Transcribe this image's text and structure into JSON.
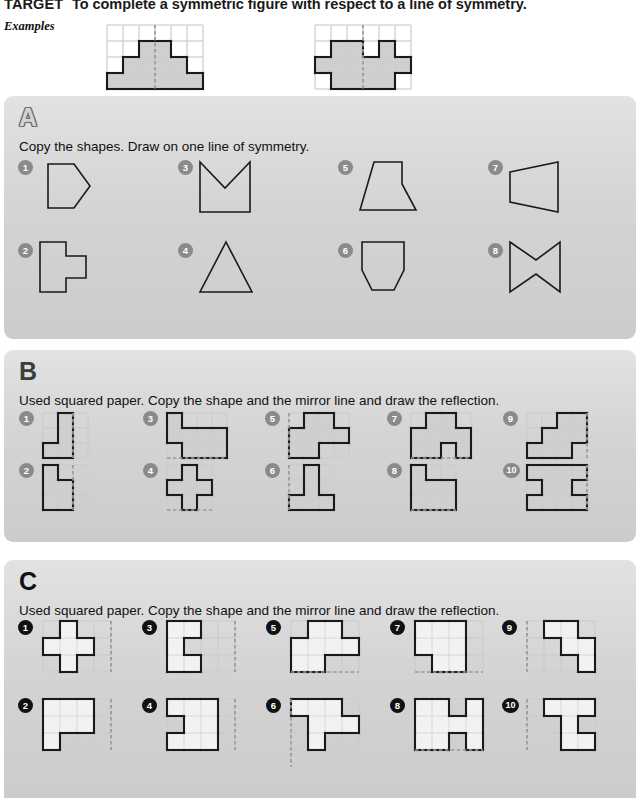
{
  "header": {
    "target_label": "TARGET",
    "target_text": "To complete a symmetric figure with respect to a line of symmetry.",
    "examples_label": "Examples"
  },
  "colors": {
    "panel_bg": "#d4d4d4",
    "shape_fill_dark": "#cfcfcf",
    "shape_fill_light": "#f2f2f2",
    "outline": "#1a1a1a",
    "grid_line": "#cdcdcd",
    "mirror_line": "#9a9a9a",
    "bullet_grey": "#8a8a8a",
    "bullet_black": "#111111"
  },
  "examples": [
    {
      "name": "example-staircase-pyramid",
      "grid": {
        "cols": 6,
        "rows": 4,
        "cell": 16
      },
      "filled_cells": [
        [
          0,
          3
        ],
        [
          1,
          3
        ],
        [
          2,
          3
        ],
        [
          3,
          3
        ],
        [
          4,
          3
        ],
        [
          5,
          3
        ],
        [
          1,
          2
        ],
        [
          2,
          2
        ],
        [
          3,
          2
        ],
        [
          4,
          2
        ],
        [
          2,
          1
        ],
        [
          3,
          1
        ]
      ],
      "mirror": {
        "orientation": "vertical",
        "at": 3
      }
    },
    {
      "name": "example-double-tower",
      "grid": {
        "cols": 6,
        "rows": 4,
        "cell": 16
      },
      "filled_cells": [
        [
          1,
          1
        ],
        [
          1,
          2
        ],
        [
          2,
          1
        ],
        [
          2,
          2
        ],
        [
          0,
          2
        ],
        [
          4,
          1
        ],
        [
          4,
          2
        ],
        [
          3,
          2
        ],
        [
          5,
          2
        ],
        [
          1,
          3
        ],
        [
          2,
          3
        ],
        [
          3,
          3
        ],
        [
          4,
          3
        ]
      ],
      "mirror": {
        "orientation": "vertical",
        "at": 3
      }
    }
  ],
  "sections": [
    {
      "id": "A",
      "letter": "A",
      "letter_style": "outline",
      "instruction": "Copy the shapes. Draw on one line of symmetry.",
      "items": [
        {
          "n": "1",
          "name": "shape-pentagon-arrow"
        },
        {
          "n": "2",
          "name": "shape-cross-tab"
        },
        {
          "n": "3",
          "name": "shape-chevron-notch"
        },
        {
          "n": "4",
          "name": "shape-triangle"
        },
        {
          "n": "5",
          "name": "shape-flask"
        },
        {
          "n": "6",
          "name": "shape-tub"
        },
        {
          "n": "7",
          "name": "shape-trapezium"
        },
        {
          "n": "8",
          "name": "shape-bowtie"
        }
      ]
    },
    {
      "id": "B",
      "letter": "B",
      "letter_style": "solid-dark",
      "instruction": "Used squared paper. Copy the shape and the mirror line and draw the reflection.",
      "items": [
        {
          "n": "1",
          "name": "grid-item-b1"
        },
        {
          "n": "2",
          "name": "grid-item-b2"
        },
        {
          "n": "3",
          "name": "grid-item-b3"
        },
        {
          "n": "4",
          "name": "grid-item-b4"
        },
        {
          "n": "5",
          "name": "grid-item-b5"
        },
        {
          "n": "6",
          "name": "grid-item-b6"
        },
        {
          "n": "7",
          "name": "grid-item-b7"
        },
        {
          "n": "8",
          "name": "grid-item-b8"
        },
        {
          "n": "9",
          "name": "grid-item-b9"
        },
        {
          "n": "10",
          "name": "grid-item-b10"
        }
      ]
    },
    {
      "id": "C",
      "letter": "C",
      "letter_style": "solid-black",
      "instruction": "Used squared paper. Copy the shape and the mirror line and draw the reflection.",
      "items": [
        {
          "n": "1",
          "name": "grid-item-c1"
        },
        {
          "n": "2",
          "name": "grid-item-c2"
        },
        {
          "n": "3",
          "name": "grid-item-c3"
        },
        {
          "n": "4",
          "name": "grid-item-c4"
        },
        {
          "n": "5",
          "name": "grid-item-c5"
        },
        {
          "n": "6",
          "name": "grid-item-c6"
        },
        {
          "n": "7",
          "name": "grid-item-c7"
        },
        {
          "n": "8",
          "name": "grid-item-c8"
        },
        {
          "n": "9",
          "name": "grid-item-c9"
        },
        {
          "n": "10",
          "name": "grid-item-c10"
        }
      ]
    }
  ],
  "section_a_shapes": {
    "1": {
      "points": "10,4 36,4 52,26 36,48 10,48",
      "w": 62,
      "h": 54
    },
    "2": {
      "points": "2,2 28,2 28,16 48,16 48,38 28,38 28,52 2,52",
      "w": 56,
      "h": 56
    },
    "3": {
      "points": "2,2 2,52 52,52 52,2 27,28",
      "w": 58,
      "h": 56
    },
    "4": {
      "points": "28,2 54,52 2,52",
      "w": 58,
      "h": 56
    },
    "5": {
      "points": "16,2 44,2 44,24 58,50 2,50",
      "w": 62,
      "h": 54
    },
    "6": {
      "points": "4,2 46,2 46,30 36,50 14,50 4,30",
      "w": 52,
      "h": 54
    },
    "7": {
      "points": "2,12 50,2 50,52 2,42",
      "w": 56,
      "h": 56
    },
    "8": {
      "points": "2,2 28,20 52,2 52,52 28,34 2,52",
      "w": 58,
      "h": 56
    }
  },
  "section_b_grids": [
    {
      "id": "b1",
      "cols": 3,
      "rows": 3,
      "cell": 15,
      "filled": [
        [
          1,
          0
        ],
        [
          1,
          1
        ],
        [
          0,
          2
        ],
        [
          1,
          2
        ]
      ],
      "mirror": {
        "orientation": "vertical",
        "at": 2
      }
    },
    {
      "id": "b2",
      "cols": 3,
      "rows": 3,
      "cell": 15,
      "filled": [
        [
          0,
          0
        ],
        [
          0,
          1
        ],
        [
          1,
          1
        ],
        [
          0,
          2
        ],
        [
          1,
          2
        ]
      ],
      "mirror": {
        "orientation": "vertical",
        "at": 2
      }
    },
    {
      "id": "b3",
      "cols": 4,
      "rows": 3,
      "cell": 15,
      "filled": [
        [
          0,
          0
        ],
        [
          0,
          1
        ],
        [
          1,
          1
        ],
        [
          2,
          1
        ],
        [
          3,
          1
        ],
        [
          1,
          2
        ],
        [
          2,
          2
        ],
        [
          3,
          2
        ]
      ],
      "mirror": {
        "orientation": "horizontal",
        "at": 3
      }
    },
    {
      "id": "b4",
      "cols": 3,
      "rows": 3,
      "cell": 15,
      "filled": [
        [
          1,
          0
        ],
        [
          0,
          1
        ],
        [
          1,
          1
        ],
        [
          2,
          1
        ],
        [
          1,
          2
        ]
      ],
      "mirror": {
        "orientation": "horizontal",
        "at": 3
      }
    },
    {
      "id": "b5",
      "cols": 4,
      "rows": 3,
      "cell": 15,
      "filled": [
        [
          1,
          0
        ],
        [
          2,
          0
        ],
        [
          0,
          1
        ],
        [
          1,
          1
        ],
        [
          2,
          1
        ],
        [
          3,
          1
        ],
        [
          0,
          2
        ],
        [
          1,
          2
        ]
      ],
      "mirror": {
        "orientation": "vertical",
        "at": 0
      }
    },
    {
      "id": "b6",
      "cols": 3,
      "rows": 3,
      "cell": 15,
      "filled": [
        [
          1,
          0
        ],
        [
          1,
          1
        ],
        [
          0,
          2
        ],
        [
          1,
          2
        ],
        [
          2,
          2
        ]
      ],
      "mirror": {
        "orientation": "vertical",
        "at": 0
      }
    },
    {
      "id": "b7",
      "cols": 4,
      "rows": 3,
      "cell": 15,
      "filled": [
        [
          1,
          0
        ],
        [
          2,
          0
        ],
        [
          0,
          1
        ],
        [
          1,
          1
        ],
        [
          2,
          1
        ],
        [
          3,
          1
        ],
        [
          0,
          2
        ],
        [
          1,
          2
        ],
        [
          3,
          2
        ]
      ],
      "mirror": {
        "orientation": "horizontal",
        "at": 3
      }
    },
    {
      "id": "b8",
      "cols": 3,
      "rows": 3,
      "cell": 15,
      "filled": [
        [
          0,
          0
        ],
        [
          0,
          1
        ],
        [
          1,
          1
        ],
        [
          2,
          1
        ],
        [
          0,
          2
        ],
        [
          1,
          2
        ],
        [
          2,
          2
        ]
      ],
      "mirror": {
        "orientation": "horizontal",
        "at": 3
      }
    },
    {
      "id": "b9",
      "cols": 4,
      "rows": 3,
      "cell": 15,
      "filled": [
        [
          2,
          0
        ],
        [
          3,
          0
        ],
        [
          1,
          1
        ],
        [
          2,
          1
        ],
        [
          3,
          1
        ],
        [
          0,
          2
        ],
        [
          1,
          2
        ],
        [
          2,
          2
        ]
      ],
      "mirror": {
        "orientation": "vertical",
        "at": 4
      }
    },
    {
      "id": "b10",
      "cols": 4,
      "rows": 3,
      "cell": 15,
      "filled": [
        [
          0,
          0
        ],
        [
          1,
          0
        ],
        [
          2,
          0
        ],
        [
          3,
          0
        ],
        [
          1,
          1
        ],
        [
          2,
          1
        ],
        [
          0,
          2
        ],
        [
          1,
          2
        ],
        [
          2,
          2
        ],
        [
          3,
          2
        ]
      ],
      "mirror": {
        "orientation": "vertical",
        "at": 4
      }
    }
  ],
  "section_c_grids": [
    {
      "id": "c1",
      "cols": 4,
      "rows": 3,
      "cell": 17,
      "filled": [
        [
          1,
          0
        ],
        [
          0,
          1
        ],
        [
          1,
          1
        ],
        [
          2,
          1
        ],
        [
          1,
          2
        ]
      ],
      "mirror": {
        "orientation": "vertical",
        "at": 4
      }
    },
    {
      "id": "c2",
      "cols": 4,
      "rows": 3,
      "cell": 17,
      "filled": [
        [
          0,
          0
        ],
        [
          1,
          0
        ],
        [
          2,
          0
        ],
        [
          0,
          1
        ],
        [
          1,
          1
        ],
        [
          2,
          1
        ],
        [
          0,
          2
        ]
      ],
      "mirror": {
        "orientation": "vertical",
        "at": 4
      }
    },
    {
      "id": "c3",
      "cols": 4,
      "rows": 3,
      "cell": 17,
      "filled": [
        [
          0,
          0
        ],
        [
          1,
          0
        ],
        [
          0,
          1
        ],
        [
          0,
          2
        ],
        [
          1,
          2
        ]
      ],
      "mirror": {
        "orientation": "vertical",
        "at": 4
      }
    },
    {
      "id": "c4",
      "cols": 4,
      "rows": 3,
      "cell": 17,
      "filled": [
        [
          0,
          0
        ],
        [
          1,
          0
        ],
        [
          2,
          0
        ],
        [
          1,
          1
        ],
        [
          2,
          1
        ],
        [
          0,
          2
        ],
        [
          1,
          2
        ],
        [
          2,
          2
        ]
      ],
      "mirror": {
        "orientation": "vertical",
        "at": 4
      }
    },
    {
      "id": "c5",
      "cols": 4,
      "rows": 3,
      "cell": 17,
      "filled": [
        [
          1,
          0
        ],
        [
          2,
          0
        ],
        [
          0,
          1
        ],
        [
          1,
          1
        ],
        [
          2,
          1
        ],
        [
          3,
          1
        ],
        [
          0,
          2
        ],
        [
          1,
          2
        ]
      ],
      "mirror": {
        "orientation": "horizontal",
        "at": 3
      }
    },
    {
      "id": "c6",
      "cols": 4,
      "rows": 4,
      "cell": 17,
      "filled": [
        [
          0,
          0
        ],
        [
          1,
          0
        ],
        [
          2,
          0
        ],
        [
          1,
          1
        ],
        [
          2,
          1
        ],
        [
          3,
          1
        ],
        [
          1,
          2
        ]
      ],
      "mirror": {
        "orientation": "vertical",
        "at": 0
      }
    },
    {
      "id": "c7",
      "cols": 4,
      "rows": 3,
      "cell": 17,
      "filled": [
        [
          0,
          0
        ],
        [
          1,
          0
        ],
        [
          2,
          0
        ],
        [
          0,
          1
        ],
        [
          1,
          1
        ],
        [
          2,
          1
        ],
        [
          1,
          2
        ],
        [
          2,
          2
        ]
      ],
      "mirror": {
        "orientation": "horizontal",
        "at": 3
      }
    },
    {
      "id": "c8",
      "cols": 4,
      "rows": 3,
      "cell": 17,
      "filled": [
        [
          0,
          0
        ],
        [
          1,
          0
        ],
        [
          3,
          0
        ],
        [
          0,
          1
        ],
        [
          1,
          1
        ],
        [
          2,
          1
        ],
        [
          3,
          1
        ],
        [
          0,
          2
        ],
        [
          1,
          2
        ],
        [
          3,
          2
        ]
      ],
      "mirror": {
        "orientation": "horizontal",
        "at": 3
      }
    },
    {
      "id": "c9",
      "cols": 4,
      "rows": 3,
      "cell": 17,
      "filled": [
        [
          1,
          0
        ],
        [
          2,
          0
        ],
        [
          2,
          1
        ],
        [
          3,
          1
        ],
        [
          3,
          2
        ]
      ],
      "mirror": {
        "orientation": "vertical",
        "at": 0
      }
    },
    {
      "id": "c10",
      "cols": 4,
      "rows": 3,
      "cell": 17,
      "filled": [
        [
          1,
          0
        ],
        [
          2,
          0
        ],
        [
          3,
          0
        ],
        [
          2,
          1
        ],
        [
          2,
          2
        ],
        [
          3,
          2
        ]
      ],
      "mirror": {
        "orientation": "vertical",
        "at": 0
      }
    }
  ],
  "layout": {
    "section_a_item_x": [
      38,
      38,
      198,
      198,
      358,
      358,
      508,
      508
    ],
    "section_a_item_y": [
      160,
      240,
      160,
      240,
      160,
      240,
      160,
      240
    ],
    "section_a_bullet_x": [
      18,
      18,
      178,
      178,
      338,
      338,
      488,
      488
    ],
    "section_a_bullet_y": [
      160,
      243,
      160,
      243,
      160,
      243,
      160,
      243
    ]
  }
}
